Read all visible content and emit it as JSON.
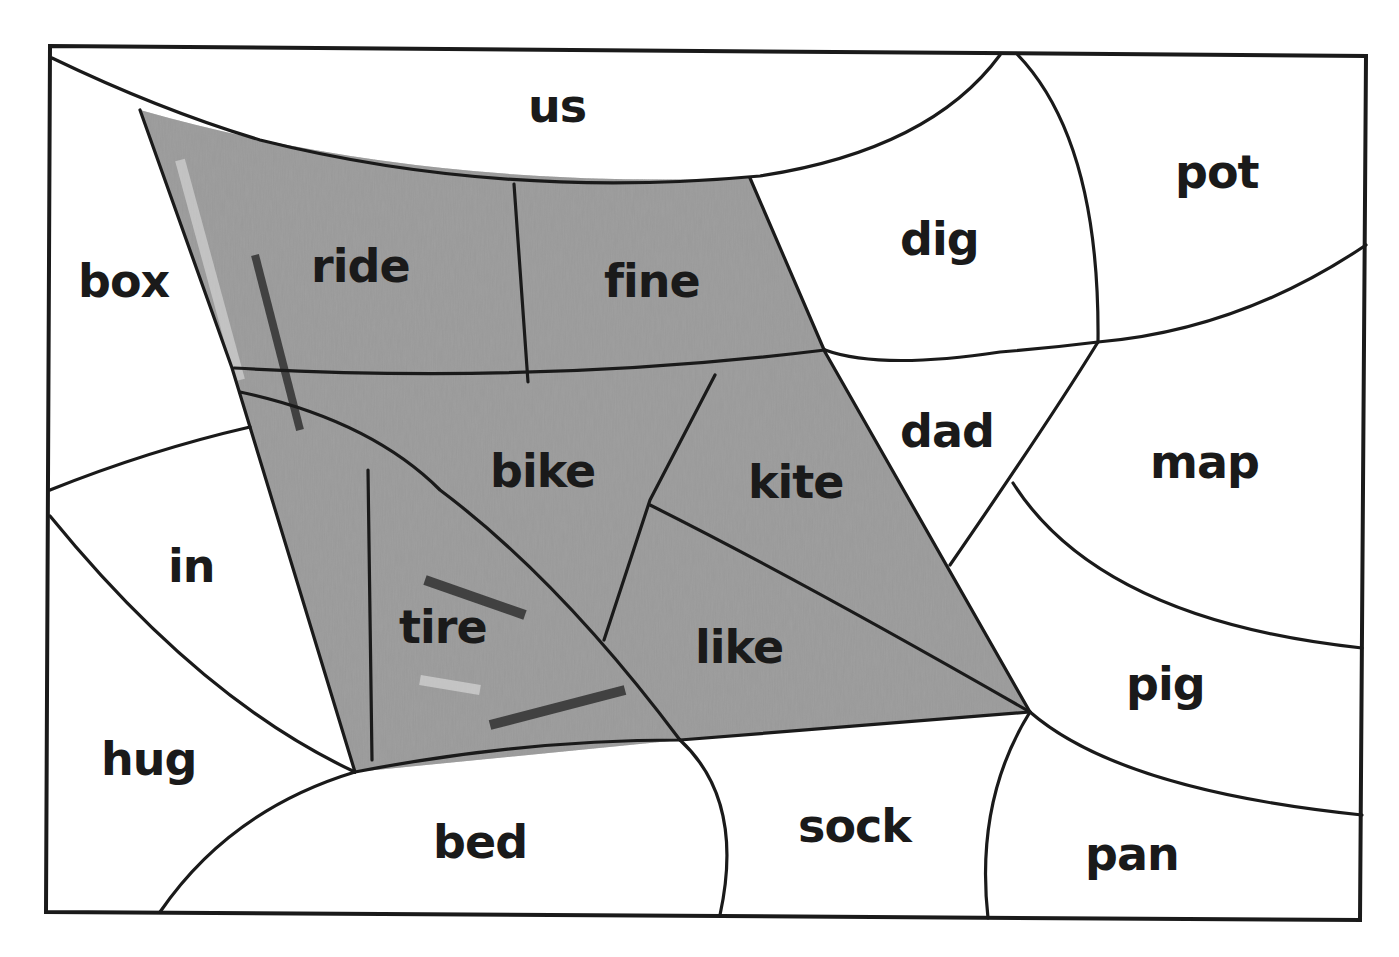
{
  "worksheet": {
    "type": "color-by-word puzzle",
    "shaded_words": [
      "ride",
      "fine",
      "bike",
      "kite",
      "tire",
      "like"
    ],
    "unshaded_words": [
      "us",
      "pot",
      "box",
      "dig",
      "dad",
      "map",
      "in",
      "pig",
      "hug",
      "bed",
      "sock",
      "pan"
    ],
    "regions": [
      {
        "id": "us",
        "label": "us",
        "shaded": false
      },
      {
        "id": "pot",
        "label": "pot",
        "shaded": false
      },
      {
        "id": "box",
        "label": "box",
        "shaded": false
      },
      {
        "id": "ride",
        "label": "ride",
        "shaded": true
      },
      {
        "id": "fine",
        "label": "fine",
        "shaded": true
      },
      {
        "id": "dig",
        "label": "dig",
        "shaded": false
      },
      {
        "id": "dad",
        "label": "dad",
        "shaded": false
      },
      {
        "id": "map",
        "label": "map",
        "shaded": false
      },
      {
        "id": "bike",
        "label": "bike",
        "shaded": true
      },
      {
        "id": "kite",
        "label": "kite",
        "shaded": true
      },
      {
        "id": "in",
        "label": "in",
        "shaded": false
      },
      {
        "id": "tire",
        "label": "tire",
        "shaded": true
      },
      {
        "id": "like",
        "label": "like",
        "shaded": true
      },
      {
        "id": "pig",
        "label": "pig",
        "shaded": false
      },
      {
        "id": "hug",
        "label": "hug",
        "shaded": false
      },
      {
        "id": "bed",
        "label": "bed",
        "shaded": false
      },
      {
        "id": "sock",
        "label": "sock",
        "shaded": false
      },
      {
        "id": "pan",
        "label": "pan",
        "shaded": false
      }
    ]
  },
  "colors": {
    "line": "#1a1a1a",
    "paper": "#ffffff",
    "pencil_shading": "#8a8a8a"
  }
}
